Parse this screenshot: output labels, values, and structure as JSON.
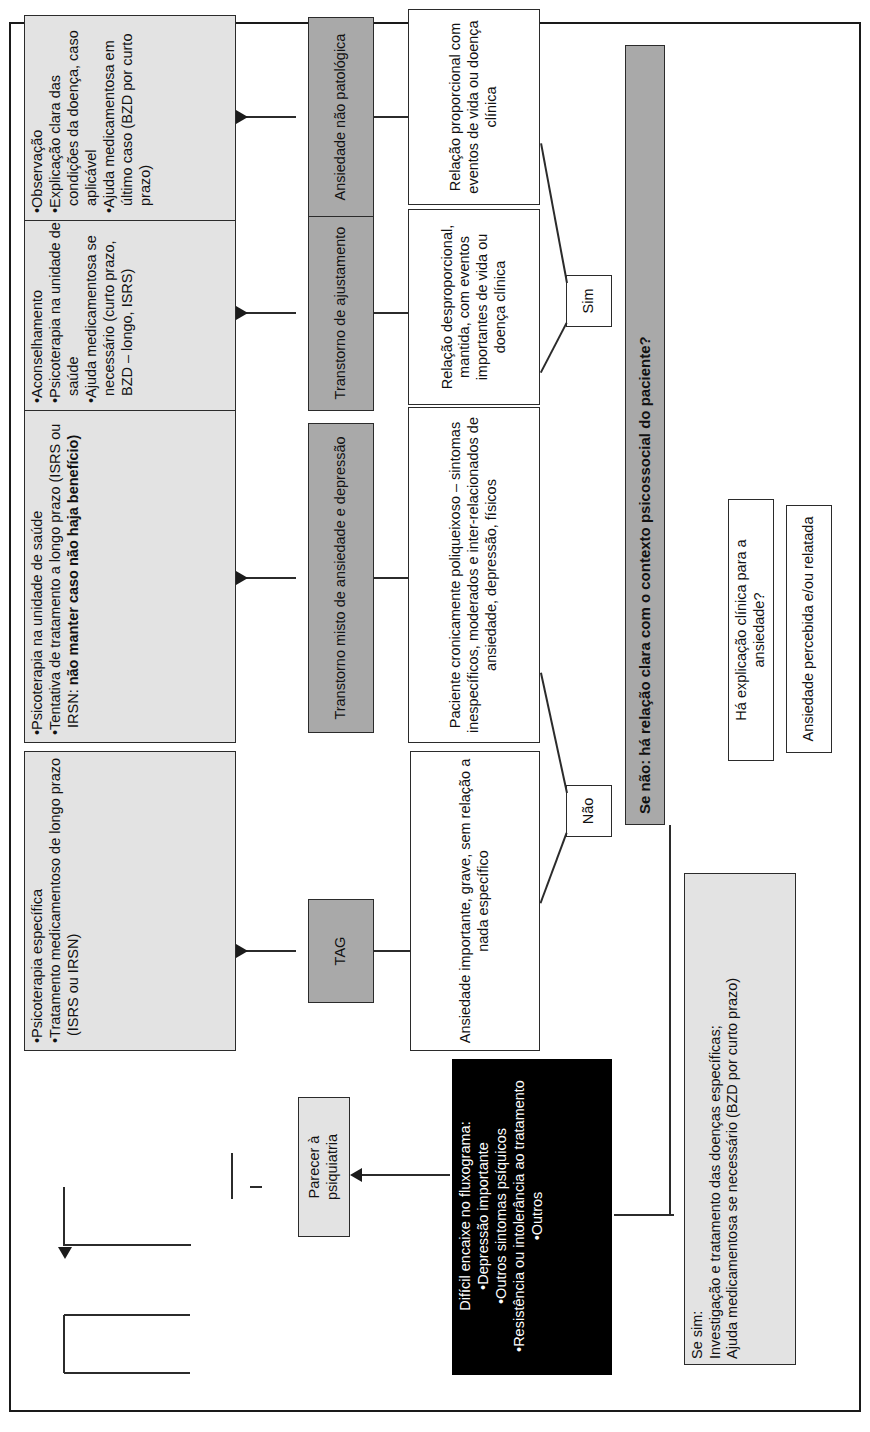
{
  "diagram": {
    "title_hidden": "",
    "colors": {
      "light_gray": "#e3e3e3",
      "mid_gray": "#a9a9a9",
      "black": "#000000",
      "line": "#2b2b2b"
    },
    "start": {
      "label": "Ansiedade percebida e/ou relatada"
    },
    "question1": {
      "label": "Há explicação clínica para a ansiedade?"
    },
    "yes_branch": {
      "label": "Se sim:\nInvestigação e tratamento das doenças específicas;\nAjuda medicamentosa se necessário (BZD por curto prazo)"
    },
    "question2": {
      "label": "Se não: há relação clara com o contexto psicossocial do paciente?"
    },
    "branch_labels": {
      "yes": "Sim",
      "no": "Não"
    },
    "psychiatry": {
      "criteria_title": "Difícil encaixe no fluxograma:",
      "criteria": [
        "•Depressão importante",
        "•Outros sintomas psíquicos",
        "•Resistência ou intolerância ao tratamento",
        "•Outros"
      ],
      "referral": "Parecer à psiquiatria"
    },
    "paths": [
      {
        "id": "tag",
        "condition": "Ansiedade importante, grave, sem relação a nada específico",
        "diagnosis": "TAG",
        "treatment_items": [
          "•Psicoterapia específica",
          "•Tratamento medicamentoso de longo prazo (ISRS ou IRSN)"
        ]
      },
      {
        "id": "misto",
        "condition": "Paciente cronicamente poliqueixoso – sintomas inespecíficos, moderados e inter-relacionados de ansiedade, depressão, físicos",
        "diagnosis": "Transtorno misto de ansiedade e depressão",
        "treatment_items": [
          "•Psicoterapia na unidade de saúde",
          "•Tentativa de tratamento a longo prazo (ISRS ou IRSN: <b>não manter caso não haja benefício)</b>"
        ]
      },
      {
        "id": "ajustamento",
        "condition": "Relação desproporcional, mantida, com eventos importantes de vida ou doença clínica",
        "diagnosis": "Transtorno de ajustamento",
        "treatment_items": [
          "•Aconselhamento",
          "•Psicoterapia na unidade de saúde",
          "•Ajuda medicamentosa se necessário (curto prazo, BZD – longo, ISRS)"
        ]
      },
      {
        "id": "nao-patologica",
        "condition": "Relação proporcional com eventos de vida ou doença clínica",
        "diagnosis": "Ansiedade não patológica",
        "treatment_items": [
          "•Observação",
          "•Explicação clara das condições da doença, caso aplicável",
          "•Ajuda medicamentosa em último caso (BZD por curto prazo)"
        ]
      }
    ]
  }
}
